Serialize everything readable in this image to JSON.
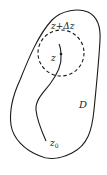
{
  "diagram": {
    "labels": {
      "region": "D",
      "point_z": "z",
      "point_z_delta": "z+Δz",
      "start_point": "z",
      "start_subscript": "0"
    },
    "colors": {
      "stroke": "#1a1a1a",
      "background": "#ffffff"
    }
  }
}
